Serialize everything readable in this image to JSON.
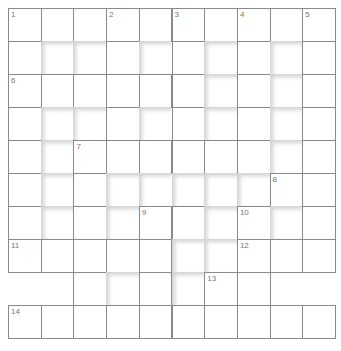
{
  "puzzle": {
    "rows": 10,
    "cols": 10,
    "cell_size": 32.7,
    "grid": [
      "WWWWWWWWWW",
      "WBBWBWBWBW",
      "WWWWWWBWBW",
      "WBBWBWBWBW",
      "WBWWWWWWBW",
      "WBWBBBBBWW",
      "WBWBWWBWBW",
      "WWWWWBBWWW",
      "VVWBWBWWVV",
      "WWWWWWWWWW"
    ],
    "numbers": [
      {
        "n": "1",
        "r": 0,
        "c": 0
      },
      {
        "n": "2",
        "r": 0,
        "c": 3
      },
      {
        "n": "3",
        "r": 0,
        "c": 5
      },
      {
        "n": "4",
        "r": 0,
        "c": 7
      },
      {
        "n": "5",
        "r": 0,
        "c": 9
      },
      {
        "n": "6",
        "r": 2,
        "c": 0
      },
      {
        "n": "7",
        "r": 4,
        "c": 2
      },
      {
        "n": "8",
        "r": 5,
        "c": 8
      },
      {
        "n": "9",
        "r": 6,
        "c": 4
      },
      {
        "n": "10",
        "r": 6,
        "c": 7
      },
      {
        "n": "11",
        "r": 7,
        "c": 0
      },
      {
        "n": "12",
        "r": 7,
        "c": 7
      },
      {
        "n": "13",
        "r": 8,
        "c": 6
      },
      {
        "n": "14",
        "r": 9,
        "c": 0
      }
    ]
  }
}
